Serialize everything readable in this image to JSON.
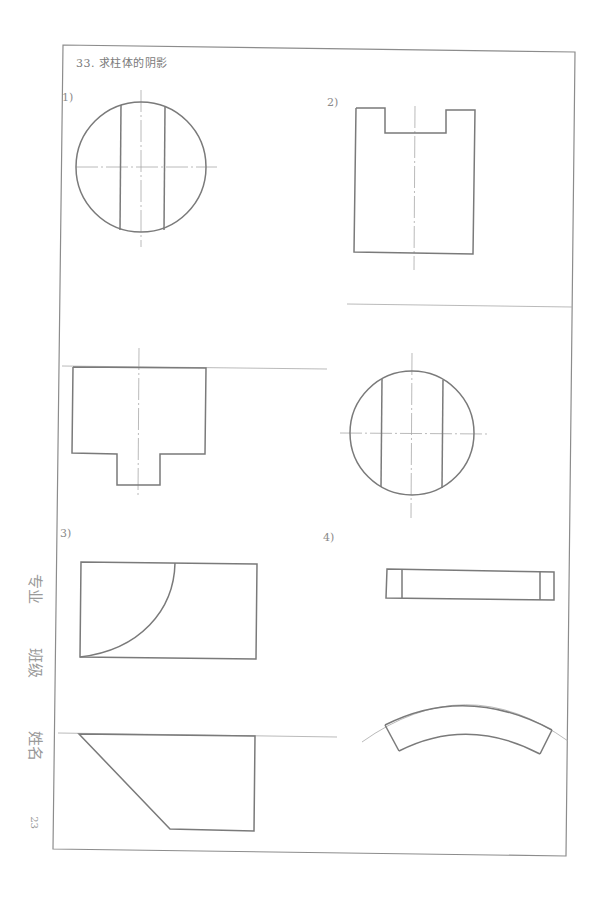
{
  "header": {
    "title": "33. 求柱体的阴影"
  },
  "problems": [
    {
      "label": "1)"
    },
    {
      "label": "2)"
    },
    {
      "label": "3)"
    },
    {
      "label": "4)"
    }
  ],
  "side_labels": {
    "major": "专业",
    "class": "班级",
    "name": "姓名"
  },
  "page_number": "23",
  "colors": {
    "border": "#8c8c8c",
    "outline": "#7a7a7a",
    "thin_line": "#a8a8a8",
    "text": "#8a8a8a"
  }
}
